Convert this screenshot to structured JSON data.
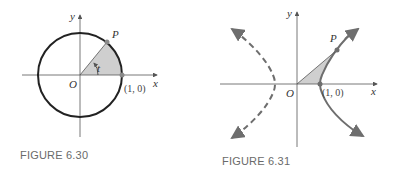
{
  "figures": [
    {
      "caption": "FIGURE 6.30",
      "labels": {
        "y_axis": "y",
        "x_axis": "x",
        "origin": "O",
        "point_p": "P",
        "point_unit": "(1, 0)",
        "angle": "t"
      },
      "curve": "unit circle x^2 + y^2 = 1",
      "shaded_region": "circular sector from (1,0) to P"
    },
    {
      "caption": "FIGURE 6.31",
      "labels": {
        "y_axis": "y",
        "x_axis": "x",
        "origin": "O",
        "point_p": "P",
        "point_unit": "(1, 0)"
      },
      "curve": "hyperbola x^2 - y^2 = 1 (right branch solid, left branch dashed)",
      "shaded_region": "hyperbolic sector from (1,0) to P"
    }
  ],
  "colors": {
    "curve": "#222222",
    "axis": "#555555",
    "shade": "#cfcfcf",
    "point": "#8a8a8a",
    "hyperbola": "#6e6e6e"
  }
}
